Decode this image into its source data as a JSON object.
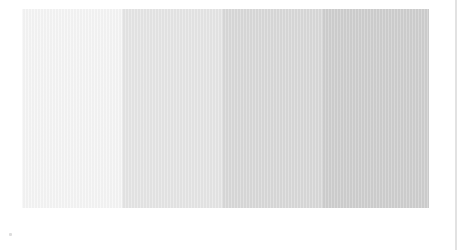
{
  "swatches": [
    {
      "name": "lightest",
      "color": "#f6f6f6",
      "width": 100
    },
    {
      "name": "light",
      "color": "#e6e6e6",
      "width": 100
    },
    {
      "name": "medium",
      "color": "#dadada",
      "width": 100
    },
    {
      "name": "dark",
      "color": "#d0d0d0",
      "width": 107
    }
  ],
  "divider_color": "#e2e2e2",
  "marker_color": "#dddddd"
}
